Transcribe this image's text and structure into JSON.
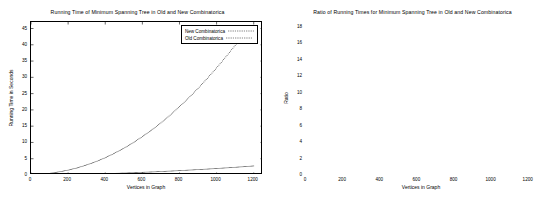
{
  "chart_data": [
    {
      "id": "left",
      "type": "line",
      "title": "Running Time of Minimum Spanning Tree in Old and New Combinatorica",
      "xlabel": "Vertices in Graph",
      "ylabel": "Running Time in Seconds",
      "xlim": [
        0,
        1250
      ],
      "ylim": [
        0,
        47
      ],
      "xticks": [
        0,
        200,
        400,
        600,
        800,
        1000,
        1200
      ],
      "yticks": [
        0,
        5,
        10,
        15,
        20,
        25,
        30,
        35,
        40,
        45
      ],
      "grid": false,
      "legend_position": "top-right",
      "series": [
        {
          "name": "New Combinatorica",
          "marker": "dotted",
          "x": [
            10,
            50,
            100,
            150,
            200,
            250,
            300,
            350,
            400,
            450,
            500,
            550,
            600,
            650,
            700,
            750,
            800,
            850,
            900,
            950,
            1000,
            1050,
            1100,
            1150,
            1200
          ],
          "values": [
            0.01,
            0.03,
            0.06,
            0.1,
            0.14,
            0.2,
            0.26,
            0.33,
            0.41,
            0.5,
            0.6,
            0.7,
            0.82,
            0.94,
            1.07,
            1.2,
            1.35,
            1.5,
            1.66,
            1.82,
            2.0,
            2.18,
            2.37,
            2.57,
            2.78
          ]
        },
        {
          "name": "Old Combinatorica",
          "marker": "dotted",
          "x": [
            10,
            50,
            100,
            150,
            200,
            250,
            300,
            350,
            400,
            450,
            500,
            550,
            600,
            650,
            700,
            750,
            800,
            850,
            900,
            950,
            1000,
            1050,
            1100,
            1150,
            1200
          ],
          "values": [
            0.05,
            0.2,
            0.5,
            0.95,
            1.5,
            2.2,
            3.1,
            4.1,
            5.3,
            6.7,
            8.2,
            9.9,
            11.8,
            13.8,
            16.0,
            18.4,
            21.0,
            23.7,
            26.6,
            29.7,
            32.9,
            36.3,
            39.8,
            43.4,
            45.9
          ]
        }
      ]
    },
    {
      "id": "right",
      "type": "line",
      "title": "Ratio of Running Times for Minimum Spanning Tree in Old and New Combinatorica",
      "xlabel": "Vertices in Graph",
      "ylabel": "Ratio",
      "xlim": [
        0,
        1250
      ],
      "ylim": [
        0,
        18.6
      ],
      "xticks": [
        0,
        200,
        400,
        600,
        800,
        1000,
        1200
      ],
      "yticks": [
        0,
        2,
        4,
        6,
        8,
        10,
        12,
        14,
        16,
        18
      ],
      "grid": false,
      "legend_position": "top-right",
      "series": [
        {
          "name": "Run time ratio",
          "marker": "dotted",
          "x": [
            5,
            20,
            40,
            60,
            80,
            100,
            120,
            140,
            160,
            180,
            200,
            215,
            230,
            240,
            245,
            250,
            260,
            280,
            300,
            330,
            360,
            400,
            440,
            480,
            520,
            560,
            600,
            650,
            700,
            750,
            800,
            850,
            900,
            950,
            1000,
            1050,
            1100,
            1150,
            1200
          ],
          "values": [
            0.2,
            2.6,
            4.3,
            4.4,
            5.0,
            5.6,
            5.9,
            6.3,
            6.8,
            7.4,
            8.3,
            9.1,
            10.0,
            10.4,
            10.5,
            6.3,
            6.8,
            7.6,
            8.3,
            9.2,
            9.9,
            10.7,
            11.4,
            12.1,
            12.6,
            13.1,
            13.5,
            14.0,
            14.5,
            14.9,
            15.3,
            15.6,
            16.0,
            16.4,
            16.7,
            17.1,
            17.4,
            17.7,
            18.1
          ]
        }
      ]
    }
  ]
}
